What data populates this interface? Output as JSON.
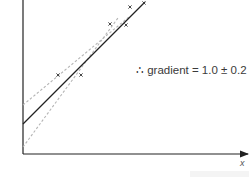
{
  "chart_data": {
    "type": "scatter",
    "title": "",
    "xlabel": "x",
    "ylabel": "",
    "annotation": "∴ gradient = 1.0 ± 0.2",
    "grid": false,
    "points": [
      {
        "x": 58,
        "y": 75
      },
      {
        "x": 81,
        "y": 75
      },
      {
        "x": 110,
        "y": 24
      },
      {
        "x": 126,
        "y": 25
      },
      {
        "x": 130,
        "y": 7
      },
      {
        "x": 144,
        "y": 3
      }
    ],
    "best_fit_line": {
      "style": "solid",
      "color": "#222222",
      "from": [
        23,
        124
      ],
      "to": [
        145,
        2
      ]
    },
    "min_gradient_line": {
      "style": "dashed",
      "color": "#b5b5b5",
      "from": [
        23,
        105
      ],
      "to": [
        130,
        16
      ]
    },
    "max_gradient_line": {
      "style": "dashed",
      "color": "#b5b5b5",
      "from": [
        23,
        147
      ],
      "to": [
        118,
        18
      ]
    },
    "gradient": 1.0,
    "gradient_uncertainty": 0.2
  },
  "labels": {
    "gradient": "∴ gradient = 1.0 ± 0.2",
    "x_axis": "x"
  },
  "colors": {
    "axis": "#222222",
    "best_fit": "#222222",
    "error_lines": "#b5b5b5",
    "points": "#333333"
  }
}
